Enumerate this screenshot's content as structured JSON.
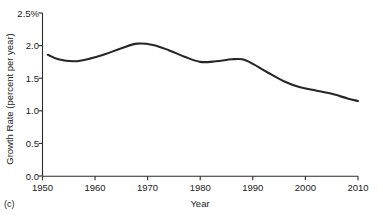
{
  "panel": {
    "label": "(c)"
  },
  "chart_data": {
    "type": "line",
    "title": "",
    "xlabel": "Year",
    "ylabel": "Growth Rate (percent per year)",
    "xlim": [
      1950,
      2010
    ],
    "ylim": [
      0.0,
      2.5
    ],
    "grid": false,
    "legend": "none",
    "xticks": [
      1950,
      1960,
      1970,
      1980,
      1990,
      2000,
      2010
    ],
    "xtick_labels": [
      "1950",
      "1960",
      "1970",
      "1980",
      "1990",
      "2000",
      "2010"
    ],
    "yticks": [
      0.0,
      0.5,
      1.0,
      1.5,
      2.0,
      2.5
    ],
    "ytick_labels": [
      "0.0",
      "0.5",
      "1.0",
      "1.5",
      "2.0",
      "2.5%"
    ],
    "line_color": "#262626",
    "series": [
      {
        "name": "Growth Rate",
        "x": [
          1951,
          1953,
          1956,
          1959,
          1962,
          1965,
          1968,
          1971,
          1974,
          1977,
          1980,
          1983,
          1986,
          1988,
          1990,
          1993,
          1996,
          1999,
          2002,
          2005,
          2008,
          2010
        ],
        "values": [
          1.86,
          1.79,
          1.76,
          1.8,
          1.87,
          1.96,
          2.03,
          2.01,
          1.93,
          1.83,
          1.75,
          1.76,
          1.79,
          1.79,
          1.72,
          1.58,
          1.45,
          1.36,
          1.31,
          1.26,
          1.19,
          1.15
        ]
      }
    ]
  }
}
